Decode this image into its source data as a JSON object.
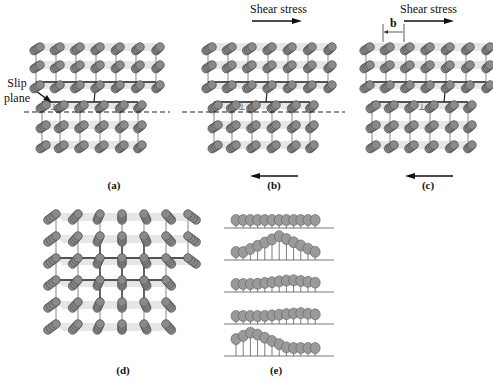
{
  "figure": {
    "panels": [
      {
        "id": "a",
        "label": "(a)",
        "x": 30,
        "y": 40,
        "w": 130,
        "h": 125,
        "type": "edge",
        "shift": 0,
        "label_x": 112,
        "label_y": 180
      },
      {
        "id": "b",
        "label": "(b)",
        "x": 203,
        "y": 40,
        "w": 135,
        "h": 125,
        "type": "edge",
        "shift": 1,
        "label_x": 273,
        "label_y": 180
      },
      {
        "id": "c",
        "label": "(c)",
        "x": 362,
        "y": 40,
        "w": 125,
        "h": 125,
        "type": "edge",
        "shift": 2,
        "label_x": 428,
        "label_y": 180
      },
      {
        "id": "d",
        "label": "(d)",
        "x": 52,
        "y": 213,
        "w": 140,
        "h": 125,
        "type": "screw",
        "label_x": 123,
        "label_y": 366
      },
      {
        "id": "e",
        "label": "(e)",
        "x": 225,
        "y": 205,
        "w": 108,
        "h": 150,
        "type": "caterpillar",
        "label_x": 276,
        "label_y": 366
      }
    ],
    "annotations": {
      "slip_plane": {
        "text_line1": "Slip",
        "text_line2": "plane",
        "x": 2,
        "y": 76
      },
      "shear_stress_b": {
        "text": "Shear stress",
        "x": 250,
        "y": 2
      },
      "shear_stress_c": {
        "text": "Shear stress",
        "x": 400,
        "y": 2
      },
      "burgers_vector": {
        "text": "b"
      }
    },
    "colors": {
      "atom": "#8a8a8a",
      "atom_dark": "#4a4a4a",
      "bond": "#222222",
      "bond_light": "#9a9a9a",
      "dashed": "#222222"
    }
  }
}
